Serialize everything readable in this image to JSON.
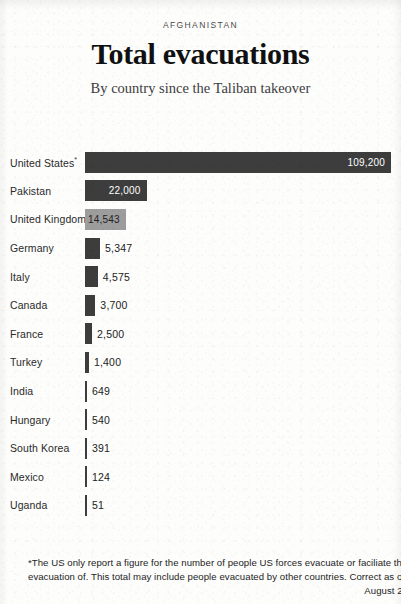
{
  "header": {
    "kicker": "AFGHANISTAN",
    "headline": "Total evacuations",
    "subhead": "By country since the Taliban takeover"
  },
  "footnote": {
    "body": "*The US only report a figure for the number of people US forces evacuate or faciliate the evacuation of. This total may include people evacuated by other countries. Correct as of",
    "date": "August 27",
    "credit": "Chart The Times and The Sunday Times • Source Times research"
  },
  "chart_data": {
    "type": "bar",
    "orientation": "horizontal",
    "title": "Total evacuations",
    "subtitle": "By country since the Taliban takeover",
    "xlabel": "",
    "ylabel": "",
    "grid": false,
    "legend": false,
    "xlim": [
      0,
      109200
    ],
    "highlight_category": "United Kingdom",
    "colors": {
      "bar": "#3d3d3d",
      "bar_highlight": "#9d9d9d",
      "value_inside": "#ffffff",
      "value_outside": "#222222",
      "background": "#fdfdfc"
    },
    "categories": [
      "United States*",
      "Pakistan",
      "United Kingdom",
      "Germany",
      "Italy",
      "Canada",
      "France",
      "Turkey",
      "India",
      "Hungary",
      "South Korea",
      "Mexico",
      "Uganda"
    ],
    "values": [
      109200,
      22000,
      14543,
      5347,
      4575,
      3700,
      2500,
      1400,
      649,
      540,
      391,
      124,
      51
    ],
    "value_labels": [
      "109,200",
      "22,000",
      "14,543",
      "5,347",
      "4,575",
      "3,700",
      "2,500",
      "1,400",
      "649",
      "540",
      "391",
      "124",
      "51"
    ],
    "rows": [
      {
        "label": "United States",
        "footnote_marker": "*",
        "value": 109200,
        "value_label": "109,200",
        "label_inside": true,
        "highlight": false
      },
      {
        "label": "Pakistan",
        "footnote_marker": "",
        "value": 22000,
        "value_label": "22,000",
        "label_inside": true,
        "highlight": false
      },
      {
        "label": "United Kingdom",
        "footnote_marker": "",
        "value": 14543,
        "value_label": "14,543",
        "label_inside": true,
        "highlight": true
      },
      {
        "label": "Germany",
        "footnote_marker": "",
        "value": 5347,
        "value_label": "5,347",
        "label_inside": false,
        "highlight": false
      },
      {
        "label": "Italy",
        "footnote_marker": "",
        "value": 4575,
        "value_label": "4,575",
        "label_inside": false,
        "highlight": false
      },
      {
        "label": "Canada",
        "footnote_marker": "",
        "value": 3700,
        "value_label": "3,700",
        "label_inside": false,
        "highlight": false
      },
      {
        "label": "France",
        "footnote_marker": "",
        "value": 2500,
        "value_label": "2,500",
        "label_inside": false,
        "highlight": false
      },
      {
        "label": "Turkey",
        "footnote_marker": "",
        "value": 1400,
        "value_label": "1,400",
        "label_inside": false,
        "highlight": false
      },
      {
        "label": "India",
        "footnote_marker": "",
        "value": 649,
        "value_label": "649",
        "label_inside": false,
        "highlight": false
      },
      {
        "label": "Hungary",
        "footnote_marker": "",
        "value": 540,
        "value_label": "540",
        "label_inside": false,
        "highlight": false
      },
      {
        "label": "South Korea",
        "footnote_marker": "",
        "value": 391,
        "value_label": "391",
        "label_inside": false,
        "highlight": false
      },
      {
        "label": "Mexico",
        "footnote_marker": "",
        "value": 124,
        "value_label": "124",
        "label_inside": false,
        "highlight": false
      },
      {
        "label": "Uganda",
        "footnote_marker": "",
        "value": 51,
        "value_label": "51",
        "label_inside": false,
        "highlight": false
      }
    ]
  }
}
